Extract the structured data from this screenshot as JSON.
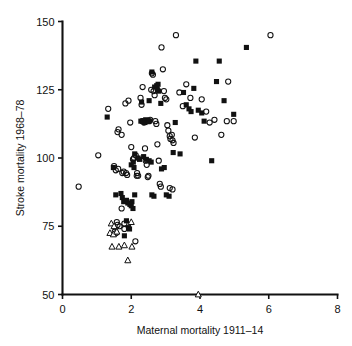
{
  "chart_data": {
    "type": "scatter",
    "title": "",
    "xlabel": "Maternal mortality 1911–14",
    "ylabel": "Stroke mortality 1968–78",
    "xlim": [
      0,
      8
    ],
    "ylim": [
      50,
      150
    ],
    "xticks": [
      0,
      2,
      4,
      6,
      8
    ],
    "yticks": [
      50,
      75,
      100,
      125,
      150
    ],
    "xtick_labels": [
      "0",
      "2",
      "4",
      "6",
      "8"
    ],
    "ytick_labels": [
      "50",
      "75",
      "100",
      "125",
      "150"
    ],
    "grid": false,
    "legend": "none",
    "series": [
      {
        "name": "open-circle",
        "marker": "open circle",
        "color": "#111111",
        "points": [
          [
            0.47,
            89.5
          ],
          [
            1.04,
            101.0
          ],
          [
            1.33,
            118.0
          ],
          [
            1.5,
            97.0
          ],
          [
            1.55,
            95.5
          ],
          [
            1.62,
            96.0
          ],
          [
            1.6,
            109.5
          ],
          [
            1.63,
            110.5
          ],
          [
            1.72,
            108.5
          ],
          [
            1.74,
            94.5
          ],
          [
            1.78,
            95.0
          ],
          [
            1.85,
            94.5
          ],
          [
            1.88,
            93.8
          ],
          [
            1.72,
            81.5
          ],
          [
            1.58,
            76.5
          ],
          [
            1.6,
            75.5
          ],
          [
            1.66,
            75.0
          ],
          [
            1.8,
            76.0
          ],
          [
            1.8,
            74.0
          ],
          [
            1.52,
            73.0
          ],
          [
            1.56,
            72.5
          ],
          [
            1.83,
            120.0
          ],
          [
            1.92,
            121.0
          ],
          [
            1.97,
            113.0
          ],
          [
            2.0,
            104.0
          ],
          [
            2.05,
            99.5
          ],
          [
            2.08,
            100.0
          ],
          [
            2.13,
            101.0
          ],
          [
            2.17,
            94.5
          ],
          [
            2.16,
            93.5
          ],
          [
            2.2,
            93.5
          ],
          [
            2.12,
            69.5
          ],
          [
            2.27,
            122.0
          ],
          [
            2.33,
            126.0
          ],
          [
            2.3,
            119.5
          ],
          [
            2.32,
            113.5
          ],
          [
            2.37,
            113.0
          ],
          [
            2.4,
            103.5
          ],
          [
            2.42,
            99.0
          ],
          [
            2.45,
            97.5
          ],
          [
            2.48,
            93.0
          ],
          [
            2.5,
            93.5
          ],
          [
            2.52,
            113.5
          ],
          [
            2.55,
            114.0
          ],
          [
            2.58,
            125.0
          ],
          [
            2.6,
            131.0
          ],
          [
            2.63,
            130.5
          ],
          [
            2.65,
            124.5
          ],
          [
            2.68,
            123.0
          ],
          [
            2.7,
            113.5
          ],
          [
            2.73,
            112.5
          ],
          [
            2.76,
            105.0
          ],
          [
            2.8,
            99.0
          ],
          [
            2.83,
            90.5
          ],
          [
            2.86,
            89.5
          ],
          [
            2.88,
            140.5
          ],
          [
            2.92,
            132.5
          ],
          [
            2.95,
            124.5
          ],
          [
            2.98,
            122.0
          ],
          [
            3.02,
            121.5
          ],
          [
            3.05,
            112.0
          ],
          [
            3.08,
            110.0
          ],
          [
            3.12,
            108.0
          ],
          [
            3.14,
            107.0
          ],
          [
            3.18,
            108.5
          ],
          [
            3.2,
            106.5
          ],
          [
            3.23,
            105.5
          ],
          [
            3.12,
            89.0
          ],
          [
            3.2,
            88.5
          ],
          [
            3.3,
            145.0
          ],
          [
            3.4,
            124.0
          ],
          [
            3.5,
            119.0
          ],
          [
            3.6,
            127.0
          ],
          [
            3.72,
            122.0
          ],
          [
            3.85,
            107.5
          ],
          [
            4.05,
            121.5
          ],
          [
            4.18,
            117.0
          ],
          [
            4.28,
            113.0
          ],
          [
            4.42,
            114.0
          ],
          [
            4.62,
            108.5
          ],
          [
            4.78,
            113.5
          ],
          [
            4.82,
            128.0
          ],
          [
            4.98,
            113.5
          ],
          [
            6.05,
            145.0
          ]
        ]
      },
      {
        "name": "filled-square",
        "marker": "filled square",
        "color": "#111111",
        "points": [
          [
            1.3,
            115.0
          ],
          [
            1.48,
            96.5
          ],
          [
            1.55,
            86.5
          ],
          [
            1.7,
            87.0
          ],
          [
            1.74,
            85.5
          ],
          [
            1.78,
            84.0
          ],
          [
            1.8,
            71.5
          ],
          [
            1.86,
            77.0
          ],
          [
            1.92,
            74.5
          ],
          [
            1.95,
            74.0
          ],
          [
            1.86,
            84.5
          ],
          [
            1.9,
            83.5
          ],
          [
            1.96,
            83.0
          ],
          [
            2.0,
            82.5
          ],
          [
            2.02,
            84.0
          ],
          [
            2.0,
            97.5
          ],
          [
            2.06,
            98.5
          ],
          [
            2.08,
            96.5
          ],
          [
            2.1,
            101.5
          ],
          [
            2.2,
            100.0
          ],
          [
            2.24,
            99.5
          ],
          [
            2.1,
            86.5
          ],
          [
            2.05,
            81.5
          ],
          [
            2.28,
            113.5
          ],
          [
            2.34,
            113.5
          ],
          [
            2.4,
            113.0
          ],
          [
            2.42,
            114.0
          ],
          [
            2.48,
            113.5
          ],
          [
            2.52,
            113.5
          ],
          [
            2.3,
            120.5
          ],
          [
            2.36,
            100.5
          ],
          [
            2.44,
            99.5
          ],
          [
            2.52,
            99.0
          ],
          [
            2.58,
            98.5
          ],
          [
            2.6,
            86.5
          ],
          [
            2.66,
            86.0
          ],
          [
            2.52,
            121.0
          ],
          [
            2.6,
            131.5
          ],
          [
            2.68,
            126.0
          ],
          [
            2.74,
            126.5
          ],
          [
            2.76,
            125.0
          ],
          [
            2.78,
            127.0
          ],
          [
            2.8,
            124.5
          ],
          [
            2.86,
            120.0
          ],
          [
            2.88,
            96.0
          ],
          [
            2.96,
            96.5
          ],
          [
            3.02,
            86.5
          ],
          [
            3.1,
            86.0
          ],
          [
            3.22,
            102.0
          ],
          [
            3.28,
            113.0
          ],
          [
            3.42,
            101.5
          ],
          [
            3.52,
            124.0
          ],
          [
            3.6,
            119.5
          ],
          [
            3.68,
            118.0
          ],
          [
            3.74,
            117.0
          ],
          [
            3.82,
            125.5
          ],
          [
            3.88,
            135.5
          ],
          [
            3.95,
            117.5
          ],
          [
            4.05,
            116.5
          ],
          [
            4.12,
            113.5
          ],
          [
            4.34,
            99.0
          ],
          [
            4.48,
            128.0
          ],
          [
            4.56,
            135.5
          ],
          [
            4.7,
            121.0
          ],
          [
            4.98,
            116.0
          ],
          [
            5.35,
            140.5
          ]
        ]
      },
      {
        "name": "open-triangle",
        "marker": "open triangle",
        "color": "#111111",
        "points": [
          [
            1.42,
            76.0
          ],
          [
            1.5,
            75.0
          ],
          [
            1.38,
            72.5
          ],
          [
            1.48,
            72.0
          ],
          [
            1.58,
            73.0
          ],
          [
            1.44,
            67.5
          ],
          [
            1.64,
            67.5
          ],
          [
            1.8,
            68.0
          ],
          [
            1.9,
            62.5
          ],
          [
            2.0,
            76.5
          ],
          [
            2.02,
            67.5
          ],
          [
            3.95,
            50.0
          ]
        ]
      }
    ]
  },
  "axes": {
    "y_axis_title": "Stroke mortality 1968–78",
    "x_axis_title": "Maternal mortality 1911–14"
  }
}
